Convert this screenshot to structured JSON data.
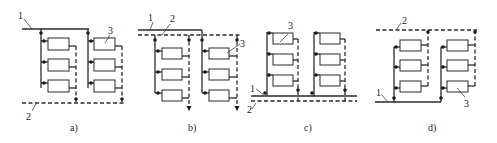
{
  "figure": {
    "panels": [
      {
        "id": "a",
        "caption": "a)",
        "labels": {
          "supply": "1",
          "return": "2",
          "radiator": "3"
        }
      },
      {
        "id": "b",
        "caption": "b)",
        "labels": {
          "supply": "1",
          "return": "2",
          "radiator": "3"
        }
      },
      {
        "id": "c",
        "caption": "c)",
        "labels": {
          "supply": "1",
          "return": "2",
          "radiator": "3"
        }
      },
      {
        "id": "d",
        "caption": "d)",
        "labels": {
          "supply": "1",
          "return": "2",
          "radiator": "3"
        }
      }
    ],
    "legend_meaning": {
      "solid_line": "supply pipe",
      "dashed_line": "return pipe",
      "rectangle": "radiator",
      "dot": "valve/fitting"
    },
    "colors": {
      "line": "#2a2a2a",
      "background": "#ffffff"
    }
  }
}
